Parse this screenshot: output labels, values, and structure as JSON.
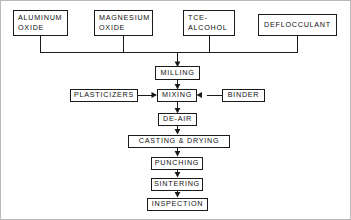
{
  "diagram": {
    "background_color": "#ffffff",
    "line_color": "#1a1a1a",
    "frame_color": "#b9b9b9",
    "nodes": {
      "aluminum_oxide": {
        "line1": "ALUMINUM",
        "line2": "OXIDE"
      },
      "magnesium_oxide": {
        "line1": "MAGNESIUM",
        "line2": "OXIDE"
      },
      "tce_alcohol": {
        "line1": "TCE-",
        "line2": "ALCOHOL"
      },
      "deflocculant": {
        "label": "DEFLOCCULANT"
      },
      "milling": {
        "label": "MILLING"
      },
      "plasticizers": {
        "label": "PLASTICIZERS"
      },
      "mixing": {
        "label": "MIXING"
      },
      "binder": {
        "label": "BINDER"
      },
      "de_air": {
        "label": "DE-AIR"
      },
      "casting_drying": {
        "label": "CASTING & DRYING"
      },
      "punching": {
        "label": "PUNCHING"
      },
      "sintering": {
        "label": "SINTERING"
      },
      "inspection": {
        "label": "INSPECTION"
      }
    }
  }
}
